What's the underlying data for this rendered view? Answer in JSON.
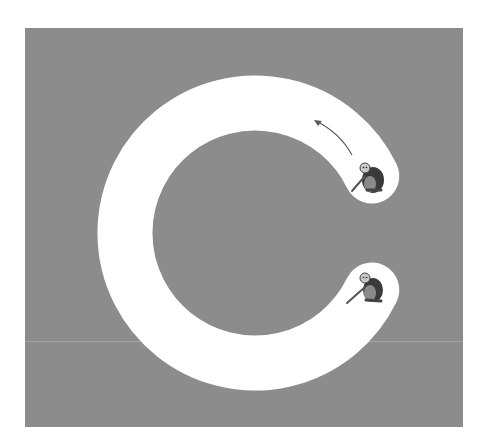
{
  "figure": {
    "colors": {
      "background": "#ffffff",
      "panel": "#8c8c8c",
      "track": "#ffffff",
      "arrow": "#555555",
      "monkey_fur": "#3a3a3a",
      "monkey_face": "#bdbdbd"
    },
    "track": {
      "shape": "C-arc",
      "center": [
        255,
        233
      ],
      "mid_radius": 130,
      "width": 55,
      "start_angle_deg": -26,
      "end_angle_deg": 26
    },
    "figures": [
      {
        "label": "monkey-upper",
        "position": "upper end of track"
      },
      {
        "label": "monkey-lower",
        "position": "lower end of track"
      }
    ],
    "arrow": {
      "direction": "counter-clockwise along track, from upper monkey toward top"
    }
  }
}
